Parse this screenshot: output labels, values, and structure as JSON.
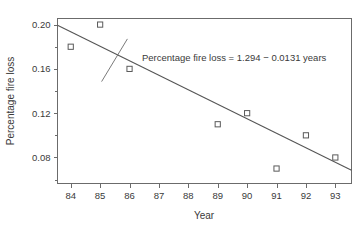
{
  "chart_data": {
    "type": "scatter",
    "title": "",
    "xlabel": "Year",
    "ylabel": "Percentage fire loss",
    "x": [
      84,
      85,
      86,
      89,
      90,
      91,
      92,
      93
    ],
    "values": [
      0.18,
      0.2,
      0.16,
      0.11,
      0.12,
      0.07,
      0.1,
      0.08
    ],
    "series": [
      {
        "name": "Percentage fire loss",
        "points": [
          {
            "x": 84,
            "y": 0.18
          },
          {
            "x": 85,
            "y": 0.2
          },
          {
            "x": 86,
            "y": 0.16
          },
          {
            "x": 89,
            "y": 0.11
          },
          {
            "x": 90,
            "y": 0.12
          },
          {
            "x": 91,
            "y": 0.07
          },
          {
            "x": 92,
            "y": 0.1
          },
          {
            "x": 93,
            "y": 0.08
          }
        ]
      }
    ],
    "xlim": [
      83.55,
      93.55
    ],
    "ylim": [
      0.0565,
      0.2055
    ],
    "xticks": [
      84,
      85,
      86,
      87,
      88,
      89,
      90,
      91,
      92,
      93
    ],
    "xtick_labels": [
      "84",
      "85",
      "86",
      "87",
      "88",
      "89",
      "90",
      "91",
      "92",
      "93"
    ],
    "yticks": [
      0.08,
      0.12,
      0.16,
      0.2
    ],
    "ytick_labels": [
      "0.08",
      "0.12",
      "0.16",
      "0.20"
    ],
    "yminor_ticks": [
      0.06,
      0.1,
      0.14,
      0.18
    ],
    "grid": false,
    "legend": null,
    "marker": "open-square",
    "fit": {
      "type": "linear",
      "intercept": 1.294,
      "slope": -0.0131,
      "equation": "Percentage fire loss = 1.294 − 0.0131 years",
      "x_start": 83.55,
      "x_end": 93.55
    },
    "annotations": [
      {
        "text": "Percentage fire loss = 1.294 − 0.0131 years",
        "x": 86.4,
        "y": 0.1925,
        "leader_to_x": 85.05,
        "leader_to_y": 0.1485
      }
    ],
    "colors": {
      "axis": "#6b6b6b",
      "marker": "#5a5a5a",
      "fit_line": "#555555",
      "text": "#3a3a3a",
      "background": "#ffffff"
    }
  }
}
